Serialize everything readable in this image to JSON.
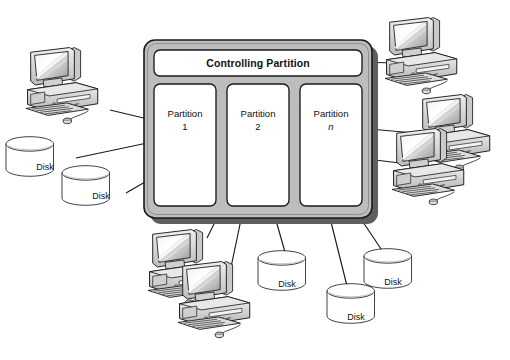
{
  "diagram": {
    "type": "system-architecture",
    "title_visible": false,
    "background_color": "#ffffff",
    "line_color": "#1a1a1a",
    "chassis_fill": "#bdbdbd",
    "chassis_shadow": "#6e6e6e",
    "panel_fill": "#ffffff"
  },
  "server": {
    "controlling_partition": {
      "label": "Controlling Partition"
    },
    "partitions": [
      {
        "name": "Partition",
        "index": "1",
        "italic_index": false
      },
      {
        "name": "Partition",
        "index": "2",
        "italic_index": false
      },
      {
        "name": "Partition",
        "index": "n",
        "italic_index": true
      }
    ]
  },
  "disks": [
    {
      "label": "Disk",
      "position": "left-upper"
    },
    {
      "label": "Disk",
      "position": "left-lower"
    },
    {
      "label": "Disk",
      "position": "bottom-center"
    },
    {
      "label": "Disk",
      "position": "bottom-right-upper"
    },
    {
      "label": "Disk",
      "position": "bottom-right-lower"
    }
  ],
  "computers": [
    {
      "name": "workstation",
      "position": "top-left"
    },
    {
      "name": "workstation",
      "position": "top-right"
    },
    {
      "name": "workstation",
      "position": "right-middle"
    },
    {
      "name": "workstation",
      "position": "right-lower"
    },
    {
      "name": "workstation",
      "position": "bottom-left-back"
    },
    {
      "name": "workstation",
      "position": "bottom-left-front"
    }
  ],
  "connections": [
    {
      "from": "top-left-computer",
      "to": "partition-1"
    },
    {
      "from": "left-upper-disk",
      "to": "partition-1"
    },
    {
      "from": "left-lower-disk",
      "to": "partition-1"
    },
    {
      "from": "top-right-computer",
      "to": "controlling-partition"
    },
    {
      "from": "right-middle-computer",
      "to": "partition-n"
    },
    {
      "from": "right-lower-computer",
      "to": "partition-n"
    },
    {
      "from": "bottom-left-back-computer",
      "to": "partition-1"
    },
    {
      "from": "bottom-left-front-computer",
      "to": "partition-1"
    },
    {
      "from": "bottom-center-disk",
      "to": "partition-2"
    },
    {
      "from": "bottom-right-lower-disk",
      "to": "partition-n"
    },
    {
      "from": "bottom-right-upper-disk",
      "to": "partition-n"
    }
  ]
}
